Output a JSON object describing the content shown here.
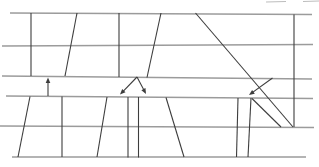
{
  "figure": {
    "width": 319,
    "height": 167,
    "background_color": "#ffffff",
    "band_line_color": "#9b9b9b",
    "shape_line_color": "#3d3d3d",
    "faint_line_color": "#bdbdbd",
    "band_lines": [
      {
        "name": "top-band-rule-1",
        "x1": 10,
        "y1": 13,
        "x2": 312,
        "y2": 14.5
      },
      {
        "name": "top-band-rule-2",
        "x1": 2,
        "y1": 46,
        "x2": 313,
        "y2": 44.5
      },
      {
        "name": "top-band-rule-3",
        "x1": 2,
        "y1": 76,
        "x2": 312,
        "y2": 79
      },
      {
        "name": "bottom-band-rule-1",
        "x1": 6,
        "y1": 96,
        "x2": 313,
        "y2": 98.5
      },
      {
        "name": "bottom-band-rule-2",
        "x1": 0,
        "y1": 126,
        "x2": 314,
        "y2": 127.5
      },
      {
        "name": "bottom-band-rule-3",
        "x1": 12,
        "y1": 157,
        "x2": 306,
        "y2": 157
      }
    ],
    "faint_lines": [
      {
        "name": "top-edge-fragment-1",
        "x1": 266,
        "y1": 2,
        "x2": 286,
        "y2": 1.5
      },
      {
        "name": "top-edge-fragment-2",
        "x1": 303,
        "y1": 1.5,
        "x2": 319,
        "y2": 1
      }
    ],
    "shape_lines": [
      {
        "name": "top-shape1-left-edge",
        "x1": 31,
        "y1": 13,
        "x2": 31,
        "y2": 76
      },
      {
        "name": "top-shape1-right-edge",
        "x1": 77,
        "y1": 13,
        "x2": 65,
        "y2": 76
      },
      {
        "name": "top-shape2-left-edge",
        "x1": 119,
        "y1": 13,
        "x2": 119,
        "y2": 77
      },
      {
        "name": "top-shape2-right-edge",
        "x1": 161,
        "y1": 13,
        "x2": 147,
        "y2": 77.5
      },
      {
        "name": "long-diagonal",
        "x1": 195.5,
        "y1": 13,
        "x2": 293,
        "y2": 127
      },
      {
        "name": "right-vertical-edge",
        "x1": 294,
        "y1": 14.5,
        "x2": 294,
        "y2": 127
      },
      {
        "name": "bottom-shape1-left-edge",
        "x1": 30,
        "y1": 96.5,
        "x2": 18,
        "y2": 157
      },
      {
        "name": "bottom-shape1-right-edge",
        "x1": 62,
        "y1": 96.5,
        "x2": 62,
        "y2": 157
      },
      {
        "name": "bottom-shape2-left-edge",
        "x1": 107,
        "y1": 97,
        "x2": 97,
        "y2": 157
      },
      {
        "name": "bottom-strip-left-edge",
        "x1": 128,
        "y1": 97,
        "x2": 128,
        "y2": 157.5
      },
      {
        "name": "bottom-strip-right-edge",
        "x1": 138.5,
        "y1": 97,
        "x2": 138.5,
        "y2": 157.5
      },
      {
        "name": "bottom-shape3-right-edge",
        "x1": 166,
        "y1": 97.5,
        "x2": 184,
        "y2": 157
      },
      {
        "name": "right-strip-left-edge",
        "x1": 238,
        "y1": 98,
        "x2": 236.5,
        "y2": 157
      },
      {
        "name": "right-strip-right-edge",
        "x1": 251,
        "y1": 98,
        "x2": 248,
        "y2": 157
      },
      {
        "name": "right-strip-short-diagonal",
        "x1": 252,
        "y1": 98.5,
        "x2": 281,
        "y2": 127
      }
    ],
    "arrows": [
      {
        "name": "up-arrow",
        "x1": 48,
        "y1": 96,
        "x2": 48,
        "y2": 77.5
      },
      {
        "name": "split-arrow-left",
        "x1": 137,
        "y1": 77,
        "x2": 120,
        "y2": 94.5
      },
      {
        "name": "split-arrow-right",
        "x1": 137,
        "y1": 77,
        "x2": 146,
        "y2": 94
      },
      {
        "name": "pointer-arrow",
        "x1": 272.5,
        "y1": 78,
        "x2": 249,
        "y2": 95
      }
    ]
  }
}
